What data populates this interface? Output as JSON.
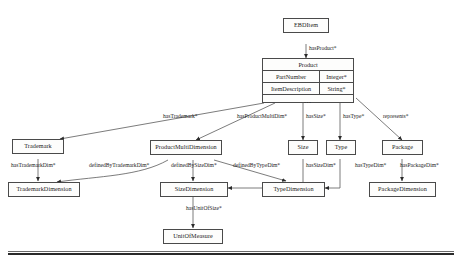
{
  "diagram": {
    "type": "uml-class-diagram",
    "stroke_color": "#4a4a4a",
    "text_color": "#1b1b1b",
    "node_fill": "#fdfdfc",
    "nodes": [
      {
        "id": "ebditem",
        "label": "EBDItem"
      },
      {
        "id": "product",
        "label": "Product"
      },
      {
        "id": "trademark",
        "label": "Trademark"
      },
      {
        "id": "productmultidimension",
        "label": "ProductMultiDimension"
      },
      {
        "id": "size",
        "label": "Size"
      },
      {
        "id": "type",
        "label": "Type"
      },
      {
        "id": "package",
        "label": "Package"
      },
      {
        "id": "trademarkdimension",
        "label": "TrademarkDimension"
      },
      {
        "id": "sizedimension",
        "label": "SizeDimension"
      },
      {
        "id": "typedimension",
        "label": "TypeDimension"
      },
      {
        "id": "packagedimension",
        "label": "PackageDimension"
      },
      {
        "id": "unitofmeasure",
        "label": "UnitOfMeasure"
      }
    ],
    "product_attributes": [
      {
        "name": "PartNumber",
        "type": "Integer*"
      },
      {
        "name": "ItemDescription",
        "type": "String*"
      }
    ],
    "product_more": "...",
    "edges": [
      {
        "id": "hasproduct",
        "label": "hasProduct*",
        "from": "ebditem",
        "to": "product"
      },
      {
        "id": "hastrademark",
        "label": "hasTrademark*",
        "from": "product",
        "to": "trademark"
      },
      {
        "id": "hasproductmultidim",
        "label": "hasProductMultiDim*",
        "from": "product",
        "to": "productmultidimension"
      },
      {
        "id": "hassize",
        "label": "hasSize*",
        "from": "product",
        "to": "size"
      },
      {
        "id": "hastype",
        "label": "hasType*",
        "from": "product",
        "to": "type"
      },
      {
        "id": "represents",
        "label": "represents*",
        "from": "product",
        "to": "package"
      },
      {
        "id": "hastrademarkdim",
        "label": "hasTrademarkDim*",
        "from": "trademark",
        "to": "trademarkdimension"
      },
      {
        "id": "definedbytrademarkdim",
        "label": "definedByTrademarkDim*",
        "from": "productmultidimension",
        "to": "trademarkdimension"
      },
      {
        "id": "definedbysizedim",
        "label": "definedBySizeDim*",
        "from": "productmultidimension",
        "to": "sizedimension"
      },
      {
        "id": "definedbytypedim",
        "label": "definedByTypeDim*",
        "from": "productmultidimension",
        "to": "typedimension"
      },
      {
        "id": "hassizedim",
        "label": "hasSizeDim*",
        "from": "size",
        "to": "sizedimension"
      },
      {
        "id": "hastypedim",
        "label": "hasTypeDim*",
        "from": "type",
        "to": "typedimension"
      },
      {
        "id": "haspackagedim",
        "label": "hasPackageDim*",
        "from": "package",
        "to": "packagedimension"
      },
      {
        "id": "hasunitofsize",
        "label": "hasUnitOfSize*",
        "from": "sizedimension",
        "to": "unitofmeasure"
      }
    ]
  }
}
